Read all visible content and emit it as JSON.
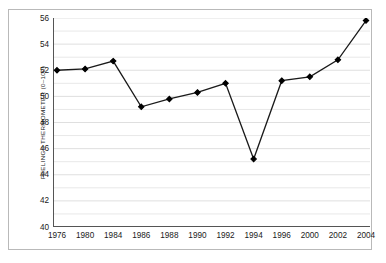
{
  "chart_data": {
    "type": "line",
    "title": "",
    "xlabel": "",
    "ylabel": "FEELINGS THERMOMETER (0–100)",
    "categories": [
      "1976",
      "1980",
      "1984",
      "1986",
      "1988",
      "1990",
      "1992",
      "1994",
      "1996",
      "2000",
      "2002",
      "2004"
    ],
    "values": [
      52.0,
      52.1,
      52.7,
      49.2,
      49.8,
      50.3,
      51.0,
      45.2,
      51.2,
      51.5,
      52.8,
      55.8
    ],
    "ylim": [
      40,
      56
    ],
    "xlim": [
      0,
      11
    ],
    "ytick_labels": [
      "40",
      "42",
      "44",
      "46",
      "48",
      "50",
      "52",
      "54",
      "56"
    ],
    "ytick_values": [
      40,
      42,
      44,
      46,
      48,
      50,
      52,
      54,
      56
    ],
    "minor_ytick_values": [
      41,
      43,
      45,
      47,
      49,
      51,
      53,
      55
    ],
    "grid": "horizontal-minor-and-major",
    "legend": "none",
    "marker": "diamond",
    "line_color": "#1a1a1a",
    "marker_color": "#000000",
    "grid_color": "#e8e8e8",
    "axis_color": "#555555",
    "background_color": "#ffffff",
    "frame_color": "#b9b9b9"
  },
  "figure": {
    "y_axis_label": "FEELINGS THERMOMETER (0–100)"
  }
}
